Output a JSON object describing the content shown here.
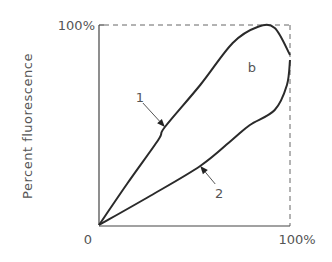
{
  "chart_data": {
    "type": "line",
    "title": "",
    "xlabel": "",
    "ylabel": "Percent fluorescence",
    "xlim": [
      0,
      100
    ],
    "ylim": [
      0,
      100
    ],
    "x_tick_labels": [
      "0",
      "100%"
    ],
    "y_tick_labels": [
      "100%"
    ],
    "grid": false,
    "frame": "dashed top and right border at 100%",
    "annotations": [
      {
        "text": "1",
        "points_to": "series-1",
        "at": [
          34.5,
          49
        ]
      },
      {
        "text": "2",
        "points_to": "series-2",
        "at": [
          53,
          29.5
        ]
      },
      {
        "text": "b",
        "at": [
          80,
          79
        ]
      }
    ],
    "series": [
      {
        "name": "1",
        "x": [
          0,
          15,
          31,
          34.5,
          53,
          70,
          83,
          92,
          100
        ],
        "y": [
          0,
          21,
          42.5,
          49,
          70,
          91,
          99,
          98.5,
          85
        ]
      },
      {
        "name": "2",
        "x": [
          100,
          98.4,
          92,
          79,
          69.6,
          53,
          26.7,
          0
        ],
        "y": [
          82.5,
          70,
          57.5,
          50,
          42.5,
          29.5,
          14.5,
          0
        ]
      }
    ]
  }
}
